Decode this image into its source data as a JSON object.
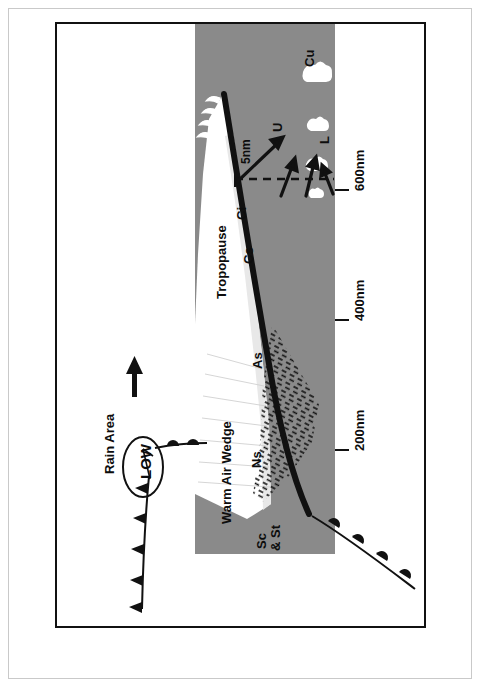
{
  "figure": {
    "type": "meteorological-cross-section",
    "orientation_note": "All text rendered rotated 90 degrees counter-clockwise",
    "colors": {
      "cold_air_gray": "#8a8a8a",
      "cloud_white": "#ffffff",
      "ink_black": "#111111",
      "page_white": "#ffffff",
      "outer_border_gray": "#c9c9c9"
    }
  },
  "labels": {
    "tropopause": "Tropopause",
    "cirrus": "Ci",
    "cirrostratus": "Cs",
    "altostratus": "As",
    "nimbostratus": "Ns",
    "stratocumulus_stratus": "Sc\n& St",
    "stratocumulus": "Sc",
    "stratus": "& St",
    "cumulus": "Cu",
    "low_cloud": "L",
    "upper_cloud": "U",
    "warm_air_wedge": "Warm Air Wedge",
    "rain_area": "Rain Area",
    "low_pressure": "LOW",
    "height_marker": "5nm"
  },
  "scale": {
    "axis_title": "",
    "ticks": [
      {
        "label": "200nm",
        "value": 200
      },
      {
        "label": "400nm",
        "value": 400
      },
      {
        "label": "600nm",
        "value": 600
      }
    ],
    "unit": "nm"
  },
  "symbols": {
    "cold_front": "triangular-barbs",
    "warm_front": "semicircle-barbs",
    "north_arrow": "up-arrow",
    "airflow_arrows": 4,
    "dashed_level_line": true,
    "precipitation": "dash-hatching"
  }
}
